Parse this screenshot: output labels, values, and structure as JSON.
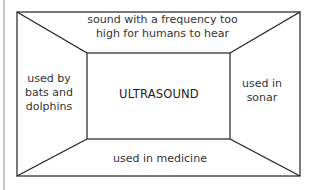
{
  "diagram": {
    "type": "frayer-model",
    "center": {
      "label": "ULTRASOUND"
    },
    "panels": {
      "top": "sound with a frequency too high for humans to hear",
      "left": "used by bats and dolphins",
      "right": "used in sonar",
      "bottom": "used in medicine"
    },
    "colors": {
      "line": "#222222",
      "text": "#333333",
      "background": "#ffffff"
    }
  }
}
